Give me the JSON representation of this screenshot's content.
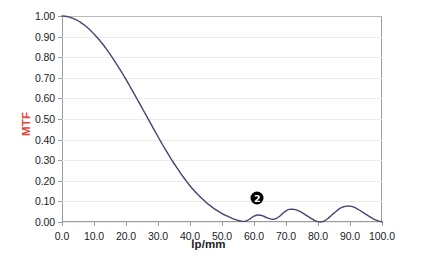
{
  "chart_data": {
    "type": "line",
    "title": "",
    "xlabel": "lp/mm",
    "ylabel": "MTF",
    "xlim": [
      0,
      100
    ],
    "ylim": [
      0,
      1.0
    ],
    "grid": true,
    "legend": null,
    "x_ticks": [
      "0.0",
      "10.0",
      "20.0",
      "30.0",
      "40.0",
      "50.0",
      "60.0",
      "70.0",
      "80.0",
      "90.0",
      "100.0"
    ],
    "x_tick_values": [
      0,
      10,
      20,
      30,
      40,
      50,
      60,
      70,
      80,
      90,
      100
    ],
    "y_ticks": [
      "0.00",
      "0.10",
      "0.20",
      "0.30",
      "0.40",
      "0.50",
      "0.60",
      "0.70",
      "0.80",
      "0.90",
      "1.00"
    ],
    "y_tick_values": [
      0,
      0.1,
      0.2,
      0.3,
      0.4,
      0.5,
      0.6,
      0.7,
      0.8,
      0.9,
      1.0
    ],
    "series": [
      {
        "name": "MTF",
        "color": "#4a4372",
        "x": [
          0,
          1,
          2,
          3,
          4,
          5,
          6,
          7,
          8,
          9,
          10,
          11,
          12,
          13,
          14,
          15,
          16,
          17,
          18,
          19,
          20,
          21,
          22,
          23,
          24,
          25,
          26,
          27,
          28,
          29,
          30,
          31,
          32,
          33,
          34,
          35,
          36,
          37,
          38,
          39,
          40,
          41,
          42,
          43,
          44,
          45,
          46,
          47,
          48,
          49,
          50,
          51,
          52,
          53,
          54,
          55,
          56,
          57,
          58,
          59,
          60,
          61,
          62,
          63,
          64,
          65,
          66,
          67,
          68,
          69,
          70,
          71,
          72,
          73,
          74,
          75,
          76,
          77,
          78,
          79,
          80,
          81,
          82,
          83,
          84,
          85,
          86,
          87,
          88,
          89,
          90,
          91,
          92,
          93,
          94,
          95,
          96,
          97,
          98,
          99,
          100
        ],
        "values": [
          1.0,
          0.999,
          0.996,
          0.991,
          0.985,
          0.977,
          0.967,
          0.956,
          0.943,
          0.929,
          0.913,
          0.896,
          0.877,
          0.858,
          0.837,
          0.815,
          0.792,
          0.768,
          0.743,
          0.718,
          0.692,
          0.665,
          0.638,
          0.61,
          0.582,
          0.554,
          0.526,
          0.498,
          0.47,
          0.442,
          0.414,
          0.387,
          0.36,
          0.334,
          0.309,
          0.284,
          0.261,
          0.238,
          0.216,
          0.196,
          0.176,
          0.158,
          0.141,
          0.125,
          0.11,
          0.096,
          0.083,
          0.071,
          0.06,
          0.05,
          0.041,
          0.033,
          0.026,
          0.019,
          0.013,
          0.008,
          0.004,
          0.003,
          0.008,
          0.018,
          0.028,
          0.034,
          0.033,
          0.028,
          0.021,
          0.015,
          0.013,
          0.018,
          0.028,
          0.042,
          0.054,
          0.061,
          0.062,
          0.06,
          0.054,
          0.046,
          0.036,
          0.026,
          0.016,
          0.007,
          0.002,
          0.001,
          0.006,
          0.016,
          0.029,
          0.043,
          0.056,
          0.067,
          0.074,
          0.077,
          0.077,
          0.073,
          0.066,
          0.057,
          0.047,
          0.037,
          0.027,
          0.018,
          0.01,
          0.004,
          0.001
        ]
      }
    ],
    "annotations": [
      {
        "label": "2",
        "x": 61,
        "y": 0.115,
        "style": "filled-circle-black"
      }
    ]
  },
  "axis": {
    "y_axis_title": "MTF",
    "y_axis_title_color": "#e8413a",
    "x_axis_title": "lp/mm"
  },
  "colors": {
    "curve": "#4a4372",
    "grid": "#ebebeb",
    "grid_top": "#b9b9b9",
    "frame": "#9a9a9a",
    "mtf_label": "#e8413a",
    "badge_bg": "#000000",
    "badge_fg": "#ffffff",
    "background": "#ffffff",
    "tick_text": "#1b1b1b"
  }
}
